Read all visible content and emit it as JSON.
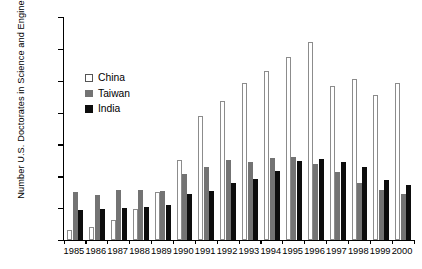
{
  "chart_data": {
    "type": "bar",
    "title": "",
    "xlabel": "",
    "ylabel": "Number U.S. Doctorates in Science and Engineering",
    "ylim": [
      0,
      3500
    ],
    "ytick_step": 500,
    "ytick_labels": [
      "3500",
      "3000",
      "2500",
      "2000",
      "1500",
      "1000",
      "500",
      "0"
    ],
    "grid": false,
    "legend_position": "upper-left-inside",
    "categories": [
      "1985",
      "1986",
      "1987",
      "1988",
      "1989",
      "1990",
      "1991",
      "1992",
      "1993",
      "1994",
      "1995",
      "1996",
      "1997",
      "1998",
      "1999",
      "2000"
    ],
    "series": [
      {
        "name": "China",
        "color": "#ffffff",
        "values": [
          150,
          205,
          310,
          490,
          750,
          1250,
          1940,
          2180,
          2470,
          2650,
          2880,
          3110,
          2410,
          2520,
          2280,
          2460
        ]
      },
      {
        "name": "Taiwan",
        "color": "#737373",
        "values": [
          750,
          710,
          790,
          780,
          770,
          1030,
          1150,
          1250,
          1230,
          1290,
          1310,
          1190,
          1060,
          900,
          790,
          730
        ]
      },
      {
        "name": "India",
        "color": "#0d0d0d",
        "values": [
          470,
          480,
          510,
          520,
          550,
          720,
          770,
          890,
          960,
          1080,
          1240,
          1270,
          1230,
          1140,
          940,
          860
        ]
      }
    ]
  },
  "legend": {
    "items": [
      {
        "label": "China",
        "swatch": "square-outline-icon"
      },
      {
        "label": "Taiwan",
        "swatch": "square-gray-icon"
      },
      {
        "label": "India",
        "swatch": "square-black-icon"
      }
    ]
  }
}
